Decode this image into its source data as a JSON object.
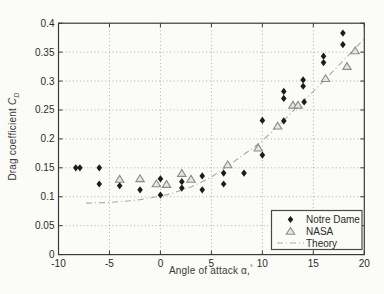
{
  "figure": {
    "xlabel": {
      "text": "Angle of attack ",
      "symbol": "α,",
      "sup": "°"
    },
    "ylabel": {
      "text": "Drag coefficient ",
      "symbol": "C",
      "sub": "D"
    }
  },
  "colors": {
    "background": "#fbfbf8",
    "axis": "#3a3a3a",
    "grid": "#9a9a96",
    "text": "#2b2b2b",
    "notre_dame_marker": "#1c1c1c",
    "nasa_marker_stroke": "#8c8c88",
    "nasa_marker_fill": "#e7e7e2",
    "theory_line": "#a9a9a3"
  },
  "chart_data": {
    "type": "scatter",
    "title": "",
    "xlabel": "Angle of attack α,°",
    "ylabel": "Drag coefficient CD",
    "xlim": [
      -10,
      20
    ],
    "ylim": [
      0,
      0.4
    ],
    "x_ticks": [
      "-10",
      "-5",
      "0",
      "5",
      "10",
      "15",
      "20"
    ],
    "y_ticks": [
      "0",
      "0.05",
      "0.1",
      "0.15",
      "0.2",
      "0.25",
      "0.3",
      "0.35",
      "0.4"
    ],
    "grid": "dotted",
    "legend_position": "lower right",
    "legend": [
      "Notre Dame",
      "NASA",
      "Theory"
    ],
    "series": [
      {
        "name": "Notre Dame",
        "marker": "filled-diamond",
        "points": [
          [
            -8.3,
            0.15
          ],
          [
            -7.9,
            0.15
          ],
          [
            -6.0,
            0.15
          ],
          [
            -6.0,
            0.122
          ],
          [
            -4.0,
            0.119
          ],
          [
            -2.0,
            0.112
          ],
          [
            0.0,
            0.131
          ],
          [
            0.0,
            0.103
          ],
          [
            2.1,
            0.126
          ],
          [
            2.1,
            0.115
          ],
          [
            4.1,
            0.136
          ],
          [
            4.1,
            0.112
          ],
          [
            6.2,
            0.141
          ],
          [
            6.2,
            0.122
          ],
          [
            8.2,
            0.141
          ],
          [
            10.0,
            0.232
          ],
          [
            10.0,
            0.172
          ],
          [
            12.1,
            0.282
          ],
          [
            12.1,
            0.27
          ],
          [
            12.1,
            0.231
          ],
          [
            14.0,
            0.302
          ],
          [
            14.0,
            0.291
          ],
          [
            14.1,
            0.264
          ],
          [
            16.0,
            0.343
          ],
          [
            16.0,
            0.332
          ],
          [
            17.9,
            0.383
          ],
          [
            17.9,
            0.363
          ]
        ]
      },
      {
        "name": "NASA",
        "marker": "open-triangle",
        "points": [
          [
            -4.0,
            0.13
          ],
          [
            -2.0,
            0.131
          ],
          [
            -0.4,
            0.122
          ],
          [
            0.6,
            0.121
          ],
          [
            2.1,
            0.14
          ],
          [
            3.0,
            0.13
          ],
          [
            6.6,
            0.155
          ],
          [
            9.6,
            0.184
          ],
          [
            11.5,
            0.222
          ],
          [
            13.0,
            0.258
          ],
          [
            13.5,
            0.258
          ],
          [
            16.2,
            0.304
          ],
          [
            18.3,
            0.325
          ],
          [
            19.1,
            0.352
          ]
        ]
      },
      {
        "name": "Theory",
        "marker": "dash-dot-line",
        "points": [
          [
            -7.3,
            0.089
          ],
          [
            -6,
            0.0895
          ],
          [
            -5,
            0.09
          ],
          [
            -4,
            0.0915
          ],
          [
            -3,
            0.093
          ],
          [
            -2,
            0.095
          ],
          [
            -1,
            0.098
          ],
          [
            0,
            0.101
          ],
          [
            1,
            0.105
          ],
          [
            2,
            0.111
          ],
          [
            3,
            0.117
          ],
          [
            4,
            0.125
          ],
          [
            5,
            0.134
          ],
          [
            6,
            0.146
          ],
          [
            7,
            0.158
          ],
          [
            8,
            0.171
          ],
          [
            9,
            0.183
          ],
          [
            10,
            0.197
          ],
          [
            11,
            0.213
          ],
          [
            12,
            0.23
          ],
          [
            13,
            0.248
          ],
          [
            14,
            0.265
          ],
          [
            15,
            0.282
          ],
          [
            16,
            0.3
          ],
          [
            17,
            0.318
          ],
          [
            18,
            0.336
          ],
          [
            19,
            0.355
          ],
          [
            20,
            0.373
          ]
        ]
      }
    ]
  }
}
